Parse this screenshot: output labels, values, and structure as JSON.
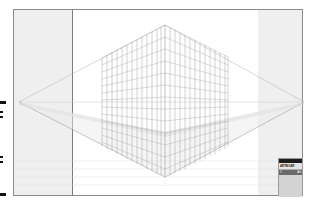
{
  "canvas": {
    "artboard_color": "#ffffff",
    "pasteboard_color": "#efefef",
    "grid_color": "#9a9a9a",
    "horizon_line_color": "#c8c8c8",
    "perspective": "two-point",
    "vanishing_points": {
      "left": [
        18,
        101
      ],
      "right": [
        303,
        101
      ]
    }
  },
  "panel": {
    "title": "",
    "tab_label": "ARTBOAR",
    "row": {
      "index": "1",
      "name": "Art"
    }
  },
  "left_markers": [
    {
      "top": 101,
      "height": 2
    },
    {
      "top": 111,
      "height": 2
    },
    {
      "top": 115,
      "height": 2
    },
    {
      "top": 155,
      "height": 2
    },
    {
      "top": 160,
      "height": 2
    },
    {
      "top": 193,
      "height": 2
    }
  ]
}
